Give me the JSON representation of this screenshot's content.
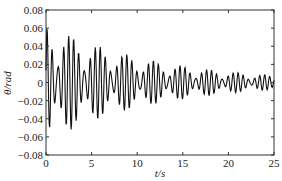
{
  "chart_data": {
    "type": "line",
    "title": "",
    "xlabel": "t/s",
    "ylabel": "θ/rad",
    "xlim": [
      0,
      25
    ],
    "ylim": [
      -0.08,
      0.08
    ],
    "xticks": [
      0,
      5,
      10,
      15,
      20,
      25
    ],
    "xtick_labels": [
      "0",
      "5",
      "10",
      "15",
      "20",
      "25"
    ],
    "yticks": [
      -0.08,
      -0.06,
      -0.04,
      -0.02,
      0,
      0.02,
      0.04,
      0.06,
      0.08
    ],
    "ytick_labels": [
      "-0.08",
      "-0.06",
      "-0.04",
      "-0.02",
      "0",
      "0.02",
      "0.04",
      "0.06",
      "0.08"
    ],
    "grid": false,
    "legend": null,
    "line_color": "#111111",
    "signal_model": {
      "description": "Damped oscillation with beating; approximate reading of the plotted curve",
      "t_step": 0.05,
      "decay_rate": 0.085,
      "components": [
        {
          "amplitude": 0.042,
          "frequency_hz": 1.72,
          "phase": 0.0
        },
        {
          "amplitude": 0.024,
          "frequency_hz": 2.05,
          "phase": 0.6
        }
      ]
    },
    "series": [
      {
        "name": "θ",
        "notable_peaks": [
          {
            "t": 0.3,
            "value": 0.033
          },
          {
            "t": 0.8,
            "value": 0.069
          },
          {
            "t": 1.3,
            "value": 0.049
          },
          {
            "t": 2.4,
            "value": 0.061
          },
          {
            "t": 3.7,
            "value": 0.052
          },
          {
            "t": 5.3,
            "value": 0.044
          },
          {
            "t": 6.7,
            "value": 0.036
          },
          {
            "t": 8.3,
            "value": 0.031
          },
          {
            "t": 10.2,
            "value": 0.028
          },
          {
            "t": 12.0,
            "value": 0.021
          },
          {
            "t": 15.0,
            "value": 0.015
          },
          {
            "t": 20.0,
            "value": 0.009
          },
          {
            "t": 25.0,
            "value": 0.006
          }
        ],
        "notable_troughs": [
          {
            "t": 0.5,
            "value": -0.058
          },
          {
            "t": 0.9,
            "value": -0.066
          },
          {
            "t": 2.0,
            "value": -0.054
          },
          {
            "t": 2.5,
            "value": -0.054
          },
          {
            "t": 3.5,
            "value": -0.049
          },
          {
            "t": 5.0,
            "value": -0.043
          },
          {
            "t": 6.5,
            "value": -0.037
          },
          {
            "t": 8.0,
            "value": -0.032
          },
          {
            "t": 12.0,
            "value": -0.018
          },
          {
            "t": 15.0,
            "value": -0.012
          },
          {
            "t": 20.0,
            "value": -0.008
          },
          {
            "t": 25.0,
            "value": -0.005
          }
        ]
      }
    ]
  },
  "labels": {
    "ylabel": "θ/rad",
    "xlabel": "t/s"
  }
}
